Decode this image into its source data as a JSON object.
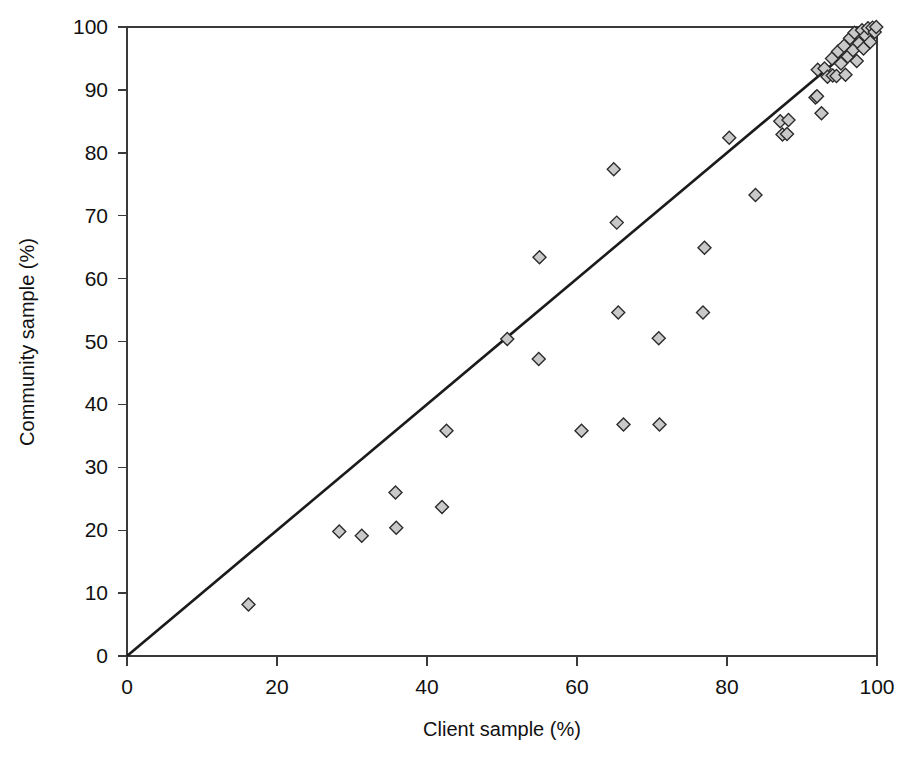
{
  "chart_data": {
    "type": "scatter",
    "title": "",
    "xlabel": "Client sample (%)",
    "ylabel": "Community sample (%)",
    "xlim": [
      0,
      100
    ],
    "ylim": [
      0,
      100
    ],
    "xticks": [
      0,
      20,
      40,
      60,
      80,
      100
    ],
    "yticks": [
      0,
      10,
      20,
      30,
      40,
      50,
      60,
      70,
      80,
      90,
      100
    ],
    "grid": false,
    "legend": null,
    "marker": {
      "shape": "diamond",
      "fill": "#c9c9c9",
      "stroke": "#2b2b2b",
      "size_px": 13
    },
    "reference_line": {
      "name": "identity-line",
      "description": "y = x diagonal",
      "x": [
        0,
        100
      ],
      "y": [
        0,
        100
      ],
      "color": "#1b1b1b"
    },
    "points": [
      {
        "x": 16.2,
        "y": 8.2
      },
      {
        "x": 28.3,
        "y": 19.8
      },
      {
        "x": 31.3,
        "y": 19.1
      },
      {
        "x": 35.8,
        "y": 26.0
      },
      {
        "x": 35.9,
        "y": 20.4
      },
      {
        "x": 42.0,
        "y": 23.7
      },
      {
        "x": 42.6,
        "y": 35.8
      },
      {
        "x": 50.7,
        "y": 50.4
      },
      {
        "x": 54.9,
        "y": 47.2
      },
      {
        "x": 55.0,
        "y": 63.4
      },
      {
        "x": 60.6,
        "y": 35.8
      },
      {
        "x": 64.9,
        "y": 77.4
      },
      {
        "x": 65.3,
        "y": 68.9
      },
      {
        "x": 65.5,
        "y": 54.6
      },
      {
        "x": 66.2,
        "y": 36.8
      },
      {
        "x": 70.9,
        "y": 50.5
      },
      {
        "x": 71.0,
        "y": 36.8
      },
      {
        "x": 76.8,
        "y": 54.6
      },
      {
        "x": 77.0,
        "y": 64.9
      },
      {
        "x": 80.3,
        "y": 82.4
      },
      {
        "x": 83.8,
        "y": 73.3
      },
      {
        "x": 87.1,
        "y": 85.0
      },
      {
        "x": 87.4,
        "y": 82.9
      },
      {
        "x": 88.0,
        "y": 83.0
      },
      {
        "x": 88.2,
        "y": 85.2
      },
      {
        "x": 91.8,
        "y": 88.8
      },
      {
        "x": 92.0,
        "y": 89.0
      },
      {
        "x": 92.6,
        "y": 86.3
      },
      {
        "x": 92.1,
        "y": 93.2
      },
      {
        "x": 93.0,
        "y": 93.4
      },
      {
        "x": 93.4,
        "y": 92.1
      },
      {
        "x": 94.1,
        "y": 92.3
      },
      {
        "x": 94.6,
        "y": 92.2
      },
      {
        "x": 94.0,
        "y": 95.0
      },
      {
        "x": 94.8,
        "y": 96.1
      },
      {
        "x": 95.2,
        "y": 94.2
      },
      {
        "x": 95.6,
        "y": 97.0
      },
      {
        "x": 95.8,
        "y": 92.4
      },
      {
        "x": 96.1,
        "y": 95.3
      },
      {
        "x": 96.4,
        "y": 98.2
      },
      {
        "x": 96.8,
        "y": 96.3
      },
      {
        "x": 97.0,
        "y": 99.1
      },
      {
        "x": 97.3,
        "y": 94.6
      },
      {
        "x": 97.6,
        "y": 97.4
      },
      {
        "x": 98.0,
        "y": 99.5
      },
      {
        "x": 98.2,
        "y": 96.6
      },
      {
        "x": 98.5,
        "y": 98.6
      },
      {
        "x": 98.8,
        "y": 99.8
      },
      {
        "x": 99.1,
        "y": 97.6
      },
      {
        "x": 99.4,
        "y": 99.9
      },
      {
        "x": 99.7,
        "y": 99.2
      },
      {
        "x": 99.9,
        "y": 100.0
      }
    ]
  },
  "axes": {
    "x_title": "Client sample (%)",
    "y_title": "Community sample (%)",
    "x_tick_labels": [
      "0",
      "20",
      "40",
      "60",
      "80",
      "100"
    ],
    "y_tick_labels": [
      "0",
      "10",
      "20",
      "30",
      "40",
      "50",
      "60",
      "70",
      "80",
      "90",
      "100"
    ]
  },
  "colors": {
    "marker_fill": "#c9c9c9",
    "marker_stroke": "#2b2b2b",
    "line": "#1b1b1b",
    "axis": "#3a3a3a",
    "text": "#111111",
    "background": "#ffffff"
  }
}
